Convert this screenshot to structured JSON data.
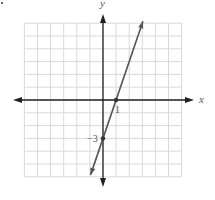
{
  "chart_data": {
    "type": "line",
    "title": "",
    "xlabel": "x",
    "ylabel": "y",
    "xlim": [
      -6,
      6
    ],
    "ylim": [
      -6,
      6
    ],
    "grid": true,
    "grid_step": 1,
    "series": [
      {
        "name": "line",
        "equation": "y = 3x - 3",
        "slope": 3,
        "intercept": -3,
        "x": [
          -0.95,
          3.05
        ],
        "y": [
          -5.85,
          6.15
        ]
      }
    ],
    "points": [
      {
        "x": 1,
        "y": 0,
        "label": "1"
      },
      {
        "x": 0,
        "y": -3,
        "label": "−3"
      }
    ],
    "annotations": [
      "1",
      "−3"
    ]
  },
  "labels": {
    "x_axis": "x",
    "y_axis": "y",
    "x_intercept": "1",
    "y_intercept": "−3"
  },
  "colors": {
    "grid": "#d9d9d9",
    "axis": "#222222",
    "line": "#555555",
    "text": "#555555"
  }
}
